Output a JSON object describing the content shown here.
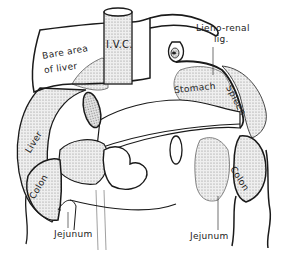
{
  "diagram": {
    "labels": {
      "ivc": "I.V.C.",
      "bare_area_line1": "Bare area",
      "bare_area_line2": "of liver",
      "lienorenal_line1": "Lieno-renal",
      "lienorenal_line2": "lig.",
      "stomach": "Stomach",
      "spleen": "Spleen",
      "liver": "Liver",
      "colon_left": "Colon",
      "colon_right": "Colon",
      "jejunum_left": "Jejunum",
      "jejunum_right": "Jejunum"
    },
    "colors": {
      "line": "#1a1a1a",
      "stipple": "#d6d6d6",
      "background": "#ffffff"
    }
  }
}
